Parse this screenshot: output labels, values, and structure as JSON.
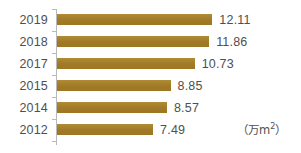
{
  "chart_data": {
    "type": "bar",
    "orientation": "horizontal",
    "title": "",
    "xlabel": "",
    "ylabel": "",
    "unit_note": "（万m²）",
    "unit_note_parts": {
      "open": "（万m",
      "sup": "2",
      "close": "）"
    },
    "categories": [
      "2019",
      "2018",
      "2017",
      "2015",
      "2014",
      "2012"
    ],
    "values": [
      12.11,
      11.86,
      10.73,
      8.85,
      8.57,
      7.49
    ],
    "value_labels": [
      "12.11",
      "11.86",
      "10.73",
      "8.85",
      "8.57",
      "7.49"
    ],
    "xlim": [
      0,
      14.5
    ],
    "grid": false,
    "legend": null,
    "bar_color": "#a8822e",
    "text_color": "#4f4f4f",
    "axis_color": "#b9b9b9",
    "background": "#ffffff",
    "bars": [
      {
        "category": "2019",
        "value": 12.11,
        "label": "12.11"
      },
      {
        "category": "2018",
        "value": 11.86,
        "label": "11.86"
      },
      {
        "category": "2017",
        "value": 10.73,
        "label": "10.73"
      },
      {
        "category": "2015",
        "value": 8.85,
        "label": "8.85"
      },
      {
        "category": "2014",
        "value": 8.57,
        "label": "8.57"
      },
      {
        "category": "2012",
        "value": 7.49,
        "label": "7.49"
      }
    ]
  }
}
